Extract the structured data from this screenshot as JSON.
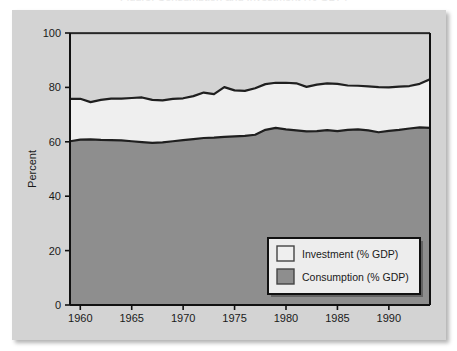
{
  "figure": {
    "background_color": "#ffffff",
    "panel_color": "#d3d3d3",
    "ghost_title": "Figure: Consumption and Investment (% GDP)"
  },
  "chart_data": {
    "type": "area",
    "title": "",
    "xlabel": "",
    "ylabel": "Percent",
    "xlim": [
      1959,
      1994
    ],
    "ylim": [
      0,
      100
    ],
    "grid": false,
    "stacked": true,
    "legend_position": "lower right",
    "x_ticks": [
      1960,
      1965,
      1970,
      1975,
      1980,
      1985,
      1990
    ],
    "x_tick_labels": [
      "1960",
      "1965",
      "1970",
      "1975",
      "1980",
      "1985",
      "1990"
    ],
    "y_ticks": [
      0,
      20,
      40,
      60,
      80,
      100
    ],
    "y_tick_labels": [
      "0",
      "20",
      "40",
      "60",
      "80",
      "100"
    ],
    "x": [
      1959,
      1960,
      1961,
      1962,
      1963,
      1964,
      1965,
      1966,
      1967,
      1968,
      1969,
      1970,
      1971,
      1972,
      1973,
      1974,
      1975,
      1976,
      1977,
      1978,
      1979,
      1980,
      1981,
      1982,
      1983,
      1984,
      1985,
      1986,
      1987,
      1988,
      1989,
      1990,
      1991,
      1992,
      1993,
      1994
    ],
    "series": [
      {
        "name": "Consumption (% GDP)",
        "color": "#8e8e8e",
        "line_color": "#1f1f1f",
        "values": [
          60.2,
          60.8,
          60.9,
          60.7,
          60.6,
          60.5,
          60.2,
          59.9,
          59.6,
          59.8,
          60.2,
          60.6,
          61.0,
          61.4,
          61.5,
          61.8,
          62.0,
          62.2,
          62.6,
          64.4,
          65.1,
          64.6,
          64.2,
          63.8,
          63.9,
          64.3,
          63.9,
          64.4,
          64.6,
          64.2,
          63.5,
          64.0,
          64.4,
          64.9,
          65.3,
          65.1
        ]
      },
      {
        "name": "Investment (% GDP)",
        "color": "#efefef",
        "line_color": "#1f1f1f",
        "values": [
          15.6,
          15.0,
          13.7,
          14.7,
          15.3,
          15.4,
          15.9,
          16.4,
          15.8,
          15.4,
          15.6,
          15.4,
          15.8,
          16.7,
          16.0,
          18.3,
          16.9,
          16.5,
          17.1,
          16.8,
          16.6,
          17.1,
          17.3,
          16.4,
          17.1,
          17.2,
          17.4,
          16.3,
          16.0,
          16.2,
          16.6,
          16.0,
          15.9,
          15.6,
          16.0,
          17.9
        ]
      }
    ],
    "stack_top": [
      75.8,
      75.8,
      74.6,
      75.4,
      75.9,
      75.9,
      76.1,
      76.3,
      75.4,
      75.2,
      75.8,
      76.0,
      76.8,
      78.1,
      77.5,
      80.1,
      78.9,
      78.7,
      79.7,
      81.2,
      81.7,
      81.7,
      81.5,
      80.2,
      81.0,
      81.5,
      81.3,
      80.7,
      80.6,
      80.4,
      80.1,
      80.0,
      80.3,
      80.5,
      81.3,
      83.0
    ],
    "top_line": 100
  },
  "legend": {
    "items": [
      {
        "label": "Investment (% GDP)",
        "swatch_color": "#efefef"
      },
      {
        "label": "Consumption (% GDP)",
        "swatch_color": "#8e8e8e"
      }
    ]
  }
}
